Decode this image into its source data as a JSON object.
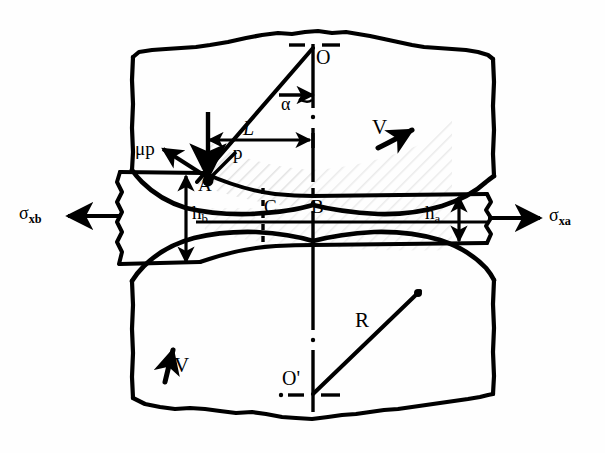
{
  "figure": {
    "type": "engineering-diagram",
    "background_color": "#ffffff",
    "line_color": "#000000",
    "hatch_color": "#d8d8d8"
  },
  "labels": {
    "roll_center_top": "O",
    "roll_center_bottom": "O'",
    "contact_point_entry": "A",
    "neutral_point": "C",
    "exit_point": "B",
    "angle_alpha": "α",
    "arc_length": "L",
    "normal_pressure": "p",
    "friction_stress": "μp",
    "roll_radius": "R",
    "velocity_top": "V",
    "velocity_bottom": "V",
    "thickness_entry_base": "h",
    "thickness_entry_sub": "b",
    "thickness_exit_base": "h",
    "thickness_exit_sub": "a",
    "stress_back_base": "σ",
    "stress_back_sub": "xb",
    "stress_front_base": "σ",
    "stress_front_sub": "xa"
  },
  "annotations": [
    {
      "name": "back-tension",
      "symbol": "σxb",
      "direction": "left"
    },
    {
      "name": "front-tension",
      "symbol": "σxa",
      "direction": "right"
    },
    {
      "name": "entry-thickness",
      "symbol": "hb"
    },
    {
      "name": "exit-thickness",
      "symbol": "ha"
    },
    {
      "name": "roll-radius",
      "symbol": "R"
    },
    {
      "name": "bite-angle",
      "symbol": "α"
    },
    {
      "name": "projected-arc",
      "symbol": "L"
    },
    {
      "name": "roll-pressure",
      "symbol": "p"
    },
    {
      "name": "friction-force",
      "symbol": "μp"
    },
    {
      "name": "roll-velocity",
      "symbol": "V"
    }
  ],
  "geometry": {
    "top_roll_center": [
      313,
      50
    ],
    "bottom_roll_center": [
      313,
      395
    ],
    "roll_radius_px": 148,
    "centerline_x": 313,
    "midline_y": 222,
    "entry_point_A": [
      205,
      182
    ],
    "point_C": [
      263,
      189
    ],
    "point_B": [
      306,
      191
    ],
    "strip_left_x": 118,
    "strip_right_x": 487
  }
}
